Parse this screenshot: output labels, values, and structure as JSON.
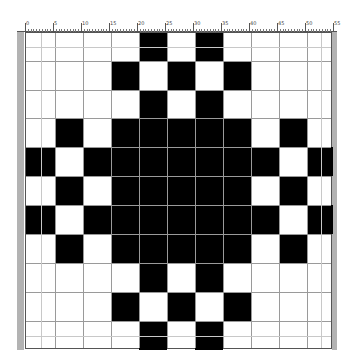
{
  "ruler": {
    "labels": [
      "0",
      "5",
      "10",
      "15",
      "20",
      "25",
      "30",
      "35",
      "40",
      "45",
      "50",
      "55"
    ]
  },
  "pattern": {
    "rows": 11,
    "cols": 11,
    "filled_color": "#000000",
    "empty_color": "#ffffff",
    "grid": [
      [
        0,
        0,
        0,
        0,
        1,
        0,
        1,
        0,
        0,
        0,
        0
      ],
      [
        0,
        0,
        0,
        1,
        0,
        1,
        0,
        1,
        0,
        0,
        0
      ],
      [
        0,
        0,
        0,
        0,
        1,
        0,
        1,
        0,
        0,
        0,
        0
      ],
      [
        0,
        1,
        0,
        1,
        1,
        1,
        1,
        1,
        0,
        1,
        0
      ],
      [
        1,
        0,
        1,
        1,
        1,
        1,
        1,
        1,
        1,
        0,
        1
      ],
      [
        0,
        1,
        0,
        1,
        1,
        1,
        1,
        1,
        0,
        1,
        0
      ],
      [
        1,
        0,
        1,
        1,
        1,
        1,
        1,
        1,
        1,
        0,
        1
      ],
      [
        0,
        1,
        0,
        1,
        1,
        1,
        1,
        1,
        0,
        1,
        0
      ],
      [
        0,
        0,
        0,
        0,
        1,
        0,
        1,
        0,
        0,
        0,
        0
      ],
      [
        0,
        0,
        0,
        1,
        0,
        1,
        0,
        1,
        0,
        0,
        0
      ],
      [
        0,
        0,
        0,
        0,
        1,
        0,
        1,
        0,
        0,
        0,
        0
      ]
    ]
  }
}
